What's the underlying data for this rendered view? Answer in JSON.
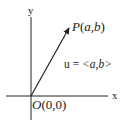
{
  "diagram": {
    "type": "vector-diagram",
    "axes": {
      "x_label": "x",
      "y_label": "y"
    },
    "origin_label": "O(0,0)",
    "origin_label_parts": {
      "letter": "O",
      "coords": "(0,0)"
    },
    "point_label": "P(a,b)",
    "point_label_parts": {
      "letter": "P",
      "open": "(",
      "a": "a",
      "comma": ",",
      "b": "b",
      "close": ")"
    },
    "vector_label": "u = <a,b>",
    "vector_label_parts": {
      "name": "u",
      "eq": " = ",
      "open": "<",
      "a": "a",
      "comma": ",",
      "b": "b",
      "close": ">"
    },
    "colors": {
      "stroke": "#222222",
      "background": "#ffffff"
    }
  }
}
